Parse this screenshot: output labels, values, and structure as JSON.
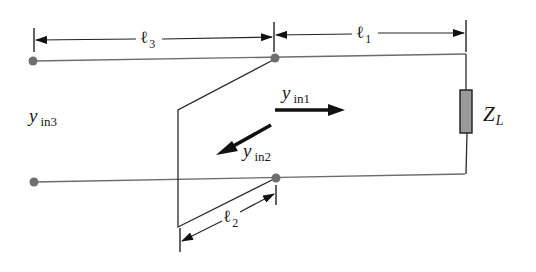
{
  "diagram": {
    "type": "transmission-line-stub-circuit",
    "colors": {
      "line": "#6b6b6b",
      "wire": "#2a2a2a",
      "node": "#6e6e6e",
      "load_fill": "#9a9a9a",
      "arrow": "#111111"
    },
    "dimensions": {
      "l3": {
        "symbol": "ℓ",
        "sub": "3"
      },
      "l1": {
        "symbol": "ℓ",
        "sub": "1"
      },
      "l2": {
        "symbol": "ℓ",
        "sub": "2"
      }
    },
    "labels": {
      "yin3": {
        "main": "y",
        "sub": "in3"
      },
      "yin1": {
        "main": "y",
        "sub": "in1"
      },
      "yin2": {
        "main": "y",
        "sub": "in2"
      },
      "load": {
        "main": "Z",
        "sub": "L"
      }
    },
    "nodes": [
      "left-top",
      "left-bottom",
      "junction-top",
      "junction-bottom"
    ],
    "components": [
      "main-line",
      "short-circuit-stub",
      "load-impedance"
    ]
  }
}
